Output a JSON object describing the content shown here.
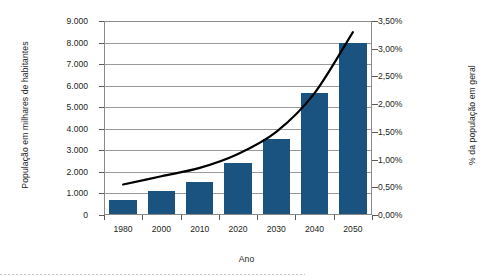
{
  "chart_data": {
    "type": "bar",
    "title": "",
    "xlabel": "Ano",
    "ylabel": "População em milhares de habitantes",
    "y2label": "% da população em geral",
    "categories": [
      "1980",
      "2000",
      "2010",
      "2020",
      "2030",
      "2040",
      "2050"
    ],
    "grid": true,
    "legend": "none",
    "ylim": [
      0,
      9000
    ],
    "y2lim": [
      0,
      3.5
    ],
    "ytick_labels": [
      "9.000",
      "8.000",
      "7.000",
      "6.000",
      "5.000",
      "4.000",
      "3.000",
      "2.000",
      "1.000",
      "0"
    ],
    "ytick_values": [
      9000,
      8000,
      7000,
      6000,
      5000,
      4000,
      3000,
      2000,
      1000,
      0
    ],
    "y2tick_labels": [
      "3,50%",
      "3,00%",
      "2,50%",
      "2,00%",
      "1,50%",
      "1,00%",
      "0,50%",
      "0,00%"
    ],
    "y2tick_values": [
      3.5,
      3.0,
      2.5,
      2.0,
      1.5,
      1.0,
      0.5,
      0.0
    ],
    "series": [
      {
        "name": "População em milhares de habitantes",
        "type": "bar",
        "axis": "left",
        "color": "#1b5380",
        "values": [
          700,
          1100,
          1550,
          2400,
          3550,
          5670,
          8000
        ]
      },
      {
        "name": "% da população em geral",
        "type": "line",
        "axis": "right",
        "color": "#000000",
        "values": [
          0.55,
          0.7,
          0.85,
          1.1,
          1.5,
          2.2,
          3.3
        ]
      }
    ]
  },
  "axes": {
    "x_title": "Ano",
    "y_left_title": "População em milhares de habitantes",
    "y_right_title": "% da população em geral"
  },
  "colors": {
    "bar": "#1b5380",
    "line": "#000000",
    "grid": "#9a9a9a",
    "frame": "#8a8a8a",
    "text": "#231f20",
    "background": "#ffffff"
  }
}
